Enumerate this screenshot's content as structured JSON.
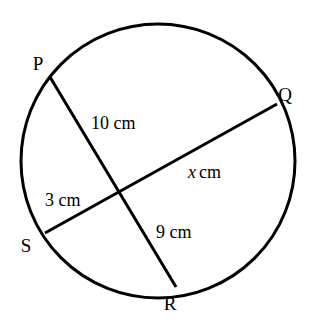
{
  "figure": {
    "kind": "circle-with-intersecting-chords",
    "background_color": "#ffffff",
    "stroke_color": "#000000",
    "circle": {
      "center_x": 158,
      "center_y": 161,
      "radius": 137,
      "stroke_width": 3
    },
    "intersection": {
      "x": 122,
      "y": 190
    }
  },
  "points": [
    {
      "id": "P",
      "label": "P",
      "x": 50,
      "y": 77,
      "label_x": 38,
      "label_y": 70
    },
    {
      "id": "Q",
      "label": "Q",
      "x": 277,
      "y": 104,
      "label_x": 285,
      "label_y": 101
    },
    {
      "id": "R",
      "label": "R",
      "x": 176,
      "y": 287,
      "label_x": 170,
      "label_y": 310
    },
    {
      "id": "S",
      "label": "S",
      "x": 45,
      "y": 233,
      "label_x": 26,
      "label_y": 252
    }
  ],
  "chords": [
    {
      "id": "PR",
      "from": "P",
      "to": "R",
      "x1": 50,
      "y1": 77,
      "x2": 176,
      "y2": 287,
      "stroke_width": 3
    },
    {
      "id": "SQ",
      "from": "S",
      "to": "Q",
      "x1": 45,
      "y1": 233,
      "x2": 277,
      "y2": 104,
      "stroke_width": 3
    }
  ],
  "measurements": [
    {
      "id": "PX",
      "segment": "P-to-intersection",
      "value": "10",
      "unit": "cm",
      "text": "10 cm",
      "is_variable": false,
      "x": 91,
      "y": 129
    },
    {
      "id": "XQ",
      "segment": "intersection-to-Q",
      "value": "x",
      "unit": "cm",
      "text": "x cm",
      "is_variable": true,
      "x": 188,
      "y": 178
    },
    {
      "id": "SX",
      "segment": "S-to-intersection",
      "value": "3",
      "unit": "cm",
      "text": "3 cm",
      "is_variable": false,
      "x": 45,
      "y": 206
    },
    {
      "id": "XR",
      "segment": "intersection-to-R",
      "value": "9",
      "unit": "cm",
      "text": "9 cm",
      "is_variable": false,
      "x": 156,
      "y": 238
    }
  ]
}
